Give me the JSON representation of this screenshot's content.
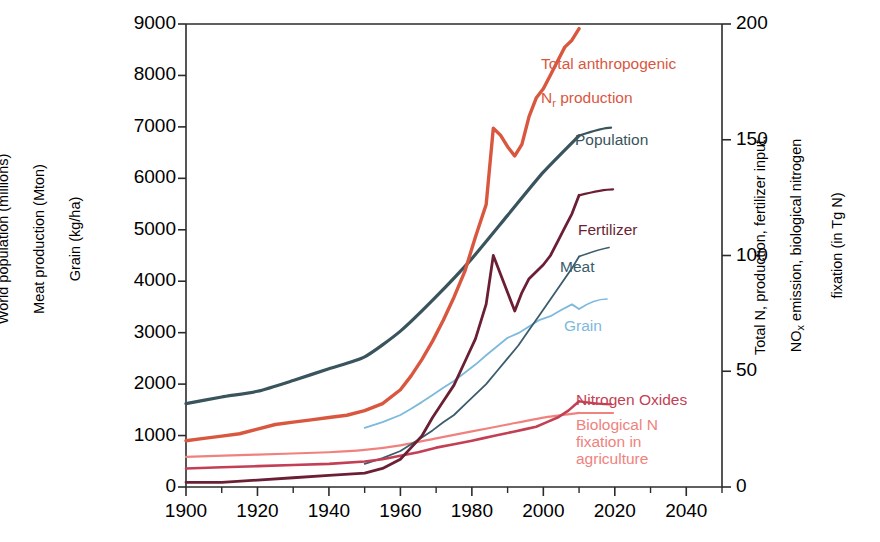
{
  "chart_data": {
    "type": "line",
    "title": "",
    "xlabel": "",
    "ylabel_left": "World population (millions)\nMeat production (Mton)\nGrain (kg/ha)",
    "ylabel_right": "Total N, production, fertilizer input,\nNOx emission, biological nitrogen\nfixation (in Tg N)",
    "xlim": [
      1900,
      2050
    ],
    "ylim_left": [
      0,
      9000
    ],
    "ylim_right": [
      0,
      200
    ],
    "xticks": [
      1900,
      1920,
      1940,
      1960,
      1980,
      2000,
      2020,
      2040
    ],
    "xticks_minor": [
      1910,
      1930,
      1950,
      1970,
      1990,
      2010,
      2030,
      2050
    ],
    "yticks_left": [
      0,
      1000,
      2000,
      3000,
      4000,
      5000,
      6000,
      7000,
      8000,
      9000
    ],
    "yticks_right": [
      0,
      50,
      100,
      150,
      200
    ],
    "grid": false,
    "legend_position": "inline-annotations",
    "series": [
      {
        "name": "Total anthropogenic Nr production",
        "label": "Total anthropogenic\nNr production",
        "color": "#d9573f",
        "axis": "right",
        "width": 3.4,
        "x": [
          1900,
          1905,
          1910,
          1915,
          1920,
          1925,
          1930,
          1935,
          1940,
          1945,
          1950,
          1955,
          1960,
          1963,
          1966,
          1969,
          1972,
          1975,
          1978,
          1981,
          1984,
          1986,
          1988,
          1990,
          1992,
          1994,
          1996,
          1998,
          2000,
          2002,
          2004,
          2006,
          2008,
          2010
        ],
        "values": [
          20,
          21,
          22,
          23,
          25,
          27,
          28,
          29,
          30,
          31,
          33,
          36,
          42,
          48,
          55,
          63,
          72,
          82,
          93,
          108,
          122,
          155,
          152,
          147,
          143,
          148,
          160,
          168,
          172,
          178,
          184,
          190,
          193,
          198
        ]
      },
      {
        "name": "Population",
        "label": "Population",
        "color": "#39545c",
        "axis": "left",
        "width": 3.2,
        "x": [
          1900,
          1910,
          1920,
          1930,
          1940,
          1950,
          1960,
          1970,
          1980,
          1990,
          2000,
          2010
        ],
        "values": [
          1620,
          1750,
          1860,
          2070,
          2300,
          2530,
          3030,
          3700,
          4440,
          5280,
          6120,
          6830
        ]
      },
      {
        "name": "Fertilizer",
        "label": "Fertilizer",
        "color": "#6b1f35",
        "axis": "right",
        "width": 2.8,
        "x": [
          1900,
          1910,
          1920,
          1930,
          1940,
          1950,
          1955,
          1960,
          1963,
          1966,
          1969,
          1972,
          1975,
          1978,
          1981,
          1984,
          1986,
          1988,
          1990,
          1992,
          1994,
          1996,
          1998,
          2000,
          2002,
          2004,
          2006,
          2008,
          2010
        ],
        "values": [
          2,
          2,
          3,
          4,
          5,
          6,
          8,
          12,
          17,
          22,
          30,
          37,
          44,
          54,
          64,
          79,
          100,
          92,
          84,
          76,
          84,
          90,
          93,
          96,
          100,
          106,
          112,
          118,
          126
        ]
      },
      {
        "name": "Meat",
        "label": "Meat",
        "color": "#3a5c6b",
        "axis": "left",
        "width": 1.8,
        "x": [
          1950,
          1955,
          1960,
          1963,
          1966,
          1969,
          1972,
          1975,
          1978,
          1981,
          1984,
          1987,
          1990,
          1993,
          1996,
          1999,
          2002,
          2005,
          2008,
          2010
        ],
        "values": [
          450,
          560,
          700,
          830,
          960,
          1100,
          1260,
          1400,
          1600,
          1800,
          2000,
          2250,
          2500,
          2750,
          3050,
          3350,
          3650,
          3950,
          4250,
          4480
        ]
      },
      {
        "name": "Grain",
        "label": "Grain",
        "color": "#7cb9dd",
        "axis": "left",
        "width": 1.8,
        "x": [
          1950,
          1955,
          1960,
          1963,
          1966,
          1969,
          1972,
          1975,
          1978,
          1981,
          1984,
          1987,
          1990,
          1993,
          1996,
          1999,
          2002,
          2005,
          2008,
          2010
        ],
        "values": [
          1150,
          1260,
          1400,
          1520,
          1650,
          1790,
          1930,
          2060,
          2220,
          2380,
          2560,
          2730,
          2900,
          2990,
          3120,
          3250,
          3320,
          3440,
          3550,
          3460
        ]
      },
      {
        "name": "Nitrogen Oxides",
        "label": "Nitrogen Oxides",
        "color": "#c23f54",
        "axis": "right",
        "width": 2.6,
        "x": [
          1900,
          1910,
          1920,
          1930,
          1940,
          1950,
          1955,
          1960,
          1965,
          1970,
          1975,
          1980,
          1983,
          1986,
          1989,
          1992,
          1995,
          1998,
          2001,
          2004,
          2007,
          2010
        ],
        "values": [
          8,
          8.5,
          9,
          9.5,
          10,
          11,
          12,
          13.5,
          15,
          17,
          18.5,
          20,
          21,
          22,
          23,
          24,
          25,
          26,
          28,
          30,
          33,
          37
        ]
      },
      {
        "name": "Biological N fixation in agriculture",
        "label": "Biological N\nfixation in\nagriculture",
        "color": "#f0827e",
        "axis": "right",
        "width": 2.2,
        "x": [
          1900,
          1920,
          1940,
          1950,
          1960,
          1970,
          1980,
          1990,
          2000,
          2010
        ],
        "values": [
          13,
          14,
          15,
          16,
          18,
          21,
          24,
          27,
          30,
          32
        ]
      }
    ],
    "annotations": [
      {
        "name": "total-n-label",
        "text": "Total anthropogenic\nNr production",
        "color": "#d9573f"
      },
      {
        "name": "population-label",
        "text": "Population",
        "color": "#39545c"
      },
      {
        "name": "fertilizer-label",
        "text": "Fertilizer",
        "color": "#6b1f35"
      },
      {
        "name": "meat-label",
        "text": "Meat",
        "color": "#3a5c6b"
      },
      {
        "name": "grain-label",
        "text": "Grain",
        "color": "#7cb9dd"
      },
      {
        "name": "nitrogen-oxides-label",
        "text": "Nitrogen Oxides",
        "color": "#c23f54"
      },
      {
        "name": "biological-n-label",
        "text": "Biological N\nfixation in\nagriculture",
        "color": "#f0827e"
      }
    ]
  },
  "axes": {
    "left_title_line1": "World population (millions)",
    "left_title_line2": "Meat production (Mton)",
    "left_title_line3": "Grain (kg/ha)",
    "right_title_line1": "Total N, production, fertilizer input,",
    "right_title_line2": "NOx emission, biological nitrogen",
    "right_title_line3": "fixation (in Tg N)"
  },
  "labels": {
    "total_n_line1": "Total anthropogenic",
    "total_n_line2_pre": "N",
    "total_n_line2_sub": "r",
    "total_n_line2_post": " production",
    "population": "Population",
    "fertilizer": "Fertilizer",
    "meat": "Meat",
    "grain": "Grain",
    "nitrogen_oxides": "Nitrogen Oxides",
    "biological_n": "Biological N\nfixation in\nagriculture"
  }
}
